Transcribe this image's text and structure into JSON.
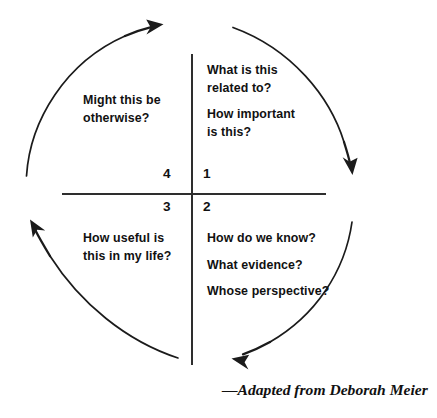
{
  "diagram": {
    "type": "circular-quadrant-diagram",
    "background_color": "#ffffff",
    "line_color": "#2e2e2e",
    "text_color": "#111111",
    "axes": {
      "horizontal_label": "horizontal-divider",
      "vertical_label": "vertical-divider"
    },
    "quadrants": [
      {
        "number": "1",
        "position": "top-right",
        "lines": [
          "What is this",
          "related to?",
          "How important",
          "is this?"
        ],
        "paragraphs": [
          [
            "What is this",
            "related to?"
          ],
          [
            "How important",
            "is this?"
          ]
        ]
      },
      {
        "number": "2",
        "position": "bottom-right",
        "lines": [
          "How do we know?",
          "What evidence?",
          "Whose perspective?"
        ],
        "paragraphs": [
          [
            "How do we know?"
          ],
          [
            "What evidence?"
          ],
          [
            "Whose perspective?"
          ]
        ]
      },
      {
        "number": "3",
        "position": "bottom-left",
        "lines": [
          "How useful is",
          "this in my life?"
        ],
        "paragraphs": [
          [
            "How useful is",
            "this in my life?"
          ]
        ]
      },
      {
        "number": "4",
        "position": "top-left",
        "lines": [
          "Might this be",
          "otherwise?"
        ],
        "paragraphs": [
          [
            "Might this be",
            "otherwise?"
          ]
        ]
      }
    ],
    "arrows": [
      {
        "name": "arc-top-right",
        "description": "arc sweeping clockwise from top-center to right side, arrowhead pointing down"
      },
      {
        "name": "arc-bottom-right",
        "description": "arc sweeping clockwise from right side to bottom-center, arrowhead pointing left"
      },
      {
        "name": "arc-bottom-left",
        "description": "arc sweeping clockwise from bottom-center to left side, arrowhead pointing up"
      },
      {
        "name": "arc-top-left",
        "description": "arc sweeping clockwise from left side to top-center, arrowhead pointing up-right"
      }
    ],
    "attribution": "—Adapted from Deborah Meier"
  }
}
